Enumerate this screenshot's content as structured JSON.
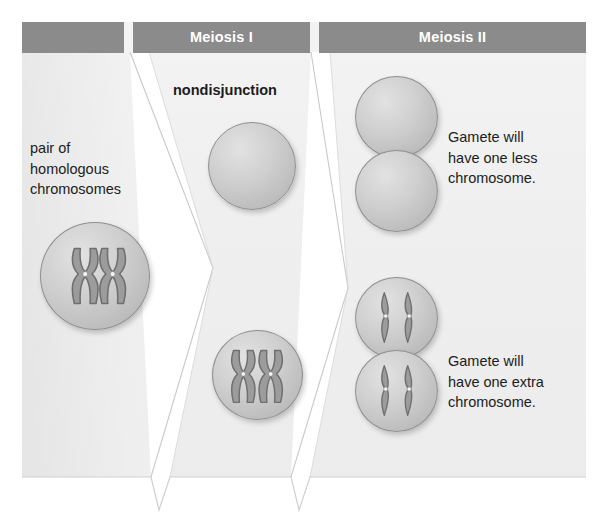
{
  "diagram": {
    "stages": [
      {
        "id": "premeiosis",
        "label": ""
      },
      {
        "id": "meiosis1",
        "label": "Meiosis I"
      },
      {
        "id": "meiosis2",
        "label": "Meiosis II"
      }
    ],
    "annotations": {
      "pair_of_homologous": "pair of\nhomologous\nchromosomes",
      "nondisjunction": "nondisjunction",
      "gamete_less": "Gamete will\nhave one less\nchromosome.",
      "gamete_extra": "Gamete will\nhave one extra\nchromosome."
    },
    "cells": [
      {
        "id": "parent",
        "stage": "premeiosis",
        "contents": "two-duplicated-chromosomes",
        "chromosome_count": 2,
        "shape": "X"
      },
      {
        "id": "m1-top",
        "stage": "meiosis1",
        "contents": "empty",
        "chromosome_count": 0,
        "shape": "none"
      },
      {
        "id": "m1-bottom",
        "stage": "meiosis1",
        "contents": "two-duplicated-chromosomes",
        "chromosome_count": 2,
        "shape": "X"
      },
      {
        "id": "m2-1",
        "stage": "meiosis2",
        "contents": "empty",
        "chromosome_count": 0,
        "shape": "none"
      },
      {
        "id": "m2-2",
        "stage": "meiosis2",
        "contents": "empty",
        "chromosome_count": 0,
        "shape": "none"
      },
      {
        "id": "m2-3",
        "stage": "meiosis2",
        "contents": "two-single-chromatids",
        "chromosome_count": 2,
        "shape": "I"
      },
      {
        "id": "m2-4",
        "stage": "meiosis2",
        "contents": "two-single-chromatids",
        "chromosome_count": 2,
        "shape": "I"
      }
    ],
    "colors": {
      "bar_fill": "#8b8b8b",
      "bar_text": "#ffffff",
      "panel_bg": "#f0f0f0",
      "cell_fill": "#cfcfcf",
      "cell_stroke": "#8f8f8f",
      "chromosome_fill": "#9a9a9a",
      "chromosome_stroke": "#6e6e6e",
      "centromere": "#f2f2f2",
      "text": "#1c1c1c",
      "divider": "#ffffff"
    }
  }
}
